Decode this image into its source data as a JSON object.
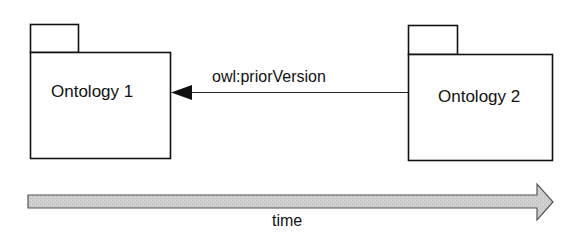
{
  "diagram": {
    "packages": [
      {
        "id": "ontology-1",
        "label": "Ontology 1"
      },
      {
        "id": "ontology-2",
        "label": "Ontology 2"
      }
    ],
    "relation": {
      "label": "owl:priorVersion",
      "from": "ontology-2",
      "to": "ontology-1"
    },
    "timeline": {
      "label": "time",
      "fill_color": "#c8c8c8",
      "stroke_color": "#555555"
    }
  }
}
